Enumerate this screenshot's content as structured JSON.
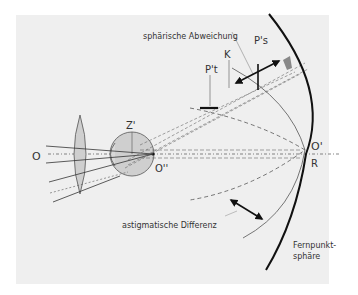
{
  "colors": {
    "background": "#ffffff",
    "panel": "#efefef",
    "stroke": "#222222",
    "thin_stroke": "#555555",
    "fill_gray": "#cfcfcf",
    "text": "#333333"
  },
  "labels": {
    "object_point": "O",
    "eye_rotation_center": "Z'",
    "fovea_image": "O''",
    "far_point_image": "O'",
    "far_point_radius": "R",
    "tangential_image": "P't",
    "sagittal_image": "P's",
    "vertex_sphere": "K",
    "spherical_aberration": "sphärische Abweichung",
    "astigmatic_difference": "astigmatische Differenz",
    "far_point_sphere_line1": "Fernpunkt-",
    "far_point_sphere_line2": "sphäre"
  },
  "elements": {
    "lens": "spectacle-lens",
    "eye": "eyeball",
    "far_point_sphere": "fernpunktsphaere-arc",
    "arrows": [
      "spherical-aberration-arrow",
      "astigmatic-difference-arrow"
    ]
  }
}
